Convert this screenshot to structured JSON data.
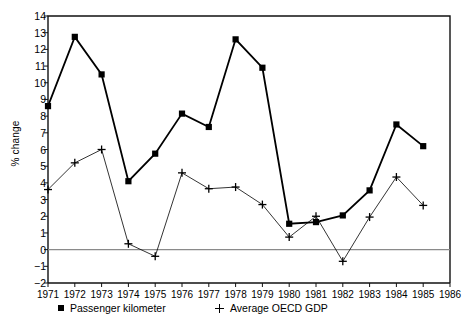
{
  "chart_data": {
    "type": "line",
    "title": "",
    "xlabel": "",
    "ylabel": "% change",
    "x": [
      1971,
      1972,
      1973,
      1974,
      1975,
      1976,
      1977,
      1978,
      1979,
      1980,
      1981,
      1982,
      1983,
      1984,
      1985
    ],
    "xlim": [
      1971,
      1986
    ],
    "ylim": [
      -2,
      14
    ],
    "xticks": [
      "1971",
      "1972",
      "1973",
      "1974",
      "1975",
      "1976",
      "1977",
      "1978",
      "1979",
      "1980",
      "1981",
      "1982",
      "1983",
      "1984",
      "1985",
      "1986"
    ],
    "yticks": [
      "14",
      "13",
      "12",
      "11",
      "10",
      "9",
      "8",
      "7",
      "6",
      "5",
      "4",
      "3",
      "2",
      "1",
      "0",
      "-1",
      "-2"
    ],
    "grid": false,
    "zero_line": true,
    "legend_position": "below",
    "series": [
      {
        "name": "Passenger kilometer",
        "marker": "square",
        "color": "#000000",
        "line_width": 1.8,
        "values": [
          8.6,
          12.75,
          10.5,
          4.1,
          5.75,
          8.15,
          7.35,
          12.6,
          10.9,
          1.55,
          1.65,
          2.05,
          3.55,
          7.5,
          6.2
        ]
      },
      {
        "name": "Average OECD GDP",
        "marker": "plus",
        "color": "#000000",
        "line_width": 0.8,
        "values": [
          3.6,
          5.2,
          6.0,
          0.35,
          -0.4,
          4.6,
          3.65,
          3.75,
          2.7,
          0.75,
          2.0,
          -0.7,
          1.95,
          4.35,
          2.65
        ]
      }
    ]
  },
  "legend": {
    "entries": [
      {
        "label": "Passenger kilometer",
        "marker": "square-marker"
      },
      {
        "label": "Average OECD GDP",
        "marker": "plus-marker"
      }
    ]
  },
  "axes": {
    "y_title": "% change"
  }
}
